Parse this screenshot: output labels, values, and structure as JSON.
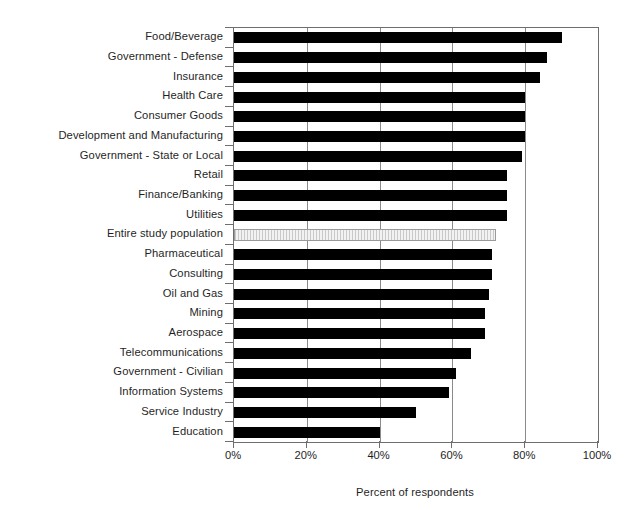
{
  "chart_data": {
    "type": "bar",
    "orientation": "horizontal",
    "title": "",
    "xlabel": "Percent of respondents",
    "ylabel": "",
    "xlim": [
      0,
      100
    ],
    "xticks": [
      "0%",
      "20%",
      "40%",
      "60%",
      "80%",
      "100%"
    ],
    "xtick_values": [
      0,
      20,
      40,
      60,
      80,
      100
    ],
    "grid": true,
    "legend": false,
    "categories": [
      "Food/Beverage",
      "Government - Defense",
      "Insurance",
      "Health Care",
      "Consumer Goods",
      "Development and Manufacturing",
      "Government - State or Local",
      "Retail",
      "Finance/Banking",
      "Utilities",
      "Entire study population",
      "Pharmaceutical",
      "Consulting",
      "Oil and Gas",
      "Mining",
      "Aerospace",
      "Telecommunications",
      "Government - Civilian",
      "Information Systems",
      "Service Industry",
      "Education"
    ],
    "values": [
      90,
      86,
      84,
      80,
      80,
      80,
      79,
      75,
      75,
      75,
      72,
      71,
      71,
      70,
      69,
      69,
      65,
      61,
      59,
      50,
      40
    ],
    "highlight_category": "Entire study population",
    "highlight_index": 10,
    "bar_color": "#000000",
    "highlight_color": "#e2e2e2",
    "highlight_border_color": "#9a9a9a",
    "axis_color": "#6e6e6e",
    "gridline_color": "#8a8a8a",
    "background_color": "#ffffff"
  }
}
